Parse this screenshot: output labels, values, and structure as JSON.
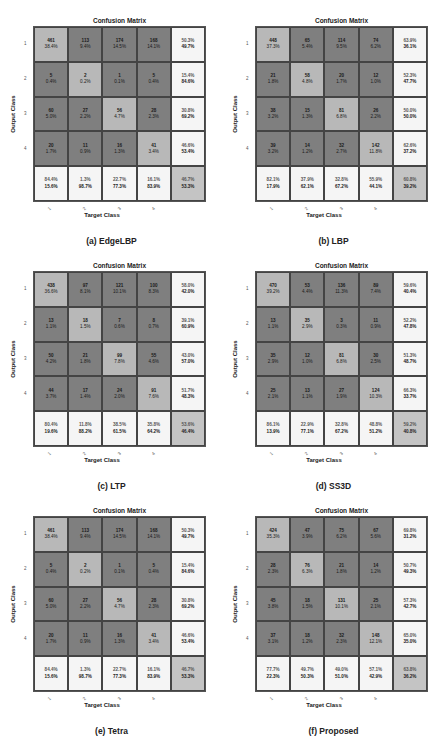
{
  "chart_data": [
    {
      "type": "heatmap",
      "title": "Confusion Matrix",
      "caption": "(a) EdgeLBP",
      "xlabel": "Target Class",
      "ylabel": "Output Class",
      "classes": [
        "1",
        "2",
        "3",
        "4"
      ],
      "counts": [
        [
          461,
          113,
          174,
          168
        ],
        [
          5,
          2,
          1,
          5
        ],
        [
          60,
          27,
          56,
          28
        ],
        [
          20,
          11,
          16,
          41
        ]
      ],
      "cell_percent": [
        [
          "38.4%",
          "9.4%",
          "14.5%",
          "14.1%"
        ],
        [
          "0.4%",
          "0.2%",
          "0.1%",
          "0.4%"
        ],
        [
          "5.0%",
          "2.2%",
          "4.7%",
          "2.3%"
        ],
        [
          "1.7%",
          "0.9%",
          "1.3%",
          "3.4%"
        ]
      ],
      "row_summary": [
        [
          "50.3%",
          "49.7%"
        ],
        [
          "15.4%",
          "84.6%"
        ],
        [
          "30.8%",
          "69.2%"
        ],
        [
          "46.6%",
          "53.4%"
        ]
      ],
      "col_summary": [
        [
          "84.4%",
          "15.6%"
        ],
        [
          "1.3%",
          "98.7%"
        ],
        [
          "22.7%",
          "77.3%"
        ],
        [
          "16.1%",
          "83.9%"
        ]
      ],
      "overall": [
        "46.7%",
        "53.3%"
      ]
    },
    {
      "type": "heatmap",
      "title": "Confusion Matrix",
      "caption": "(b) LBP",
      "xlabel": "Target Class",
      "ylabel": "Output Class",
      "classes": [
        "1",
        "2",
        "3",
        "4"
      ],
      "counts": [
        [
          448,
          65,
          114,
          74
        ],
        [
          21,
          58,
          20,
          12
        ],
        [
          38,
          15,
          81,
          26
        ],
        [
          39,
          14,
          32,
          142
        ]
      ],
      "cell_percent": [
        [
          "37.3%",
          "5.4%",
          "9.5%",
          "6.2%"
        ],
        [
          "1.8%",
          "4.8%",
          "1.7%",
          "1.0%"
        ],
        [
          "3.2%",
          "1.3%",
          "6.8%",
          "2.2%"
        ],
        [
          "3.2%",
          "1.2%",
          "2.7%",
          "11.8%"
        ]
      ],
      "row_summary": [
        [
          "63.9%",
          "36.1%"
        ],
        [
          "52.3%",
          "47.7%"
        ],
        [
          "50.0%",
          "50.0%"
        ],
        [
          "62.6%",
          "37.2%"
        ]
      ],
      "col_summary": [
        [
          "82.1%",
          "17.9%"
        ],
        [
          "37.9%",
          "62.1%"
        ],
        [
          "32.8%",
          "67.2%"
        ],
        [
          "55.9%",
          "44.1%"
        ]
      ],
      "overall": [
        "60.8%",
        "39.2%"
      ]
    },
    {
      "type": "heatmap",
      "title": "Confusion Matrix",
      "caption": "(c) LTP",
      "xlabel": "Target Class",
      "ylabel": "Output Class",
      "classes": [
        "1",
        "2",
        "3",
        "4"
      ],
      "counts": [
        [
          438,
          97,
          121,
          100
        ],
        [
          13,
          18,
          7,
          8
        ],
        [
          50,
          21,
          99,
          55
        ],
        [
          44,
          17,
          24,
          91
        ]
      ],
      "cell_percent": [
        [
          "36.6%",
          "8.1%",
          "10.1%",
          "8.3%"
        ],
        [
          "1.1%",
          "1.5%",
          "0.6%",
          "0.7%"
        ],
        [
          "4.2%",
          "1.8%",
          "7.8%",
          "4.6%"
        ],
        [
          "3.7%",
          "1.4%",
          "2.0%",
          "7.6%"
        ]
      ],
      "row_summary": [
        [
          "58.0%",
          "42.0%"
        ],
        [
          "39.1%",
          "60.9%"
        ],
        [
          "43.0%",
          "57.0%"
        ],
        [
          "51.7%",
          "48.3%"
        ]
      ],
      "col_summary": [
        [
          "80.4%",
          "19.6%"
        ],
        [
          "11.8%",
          "88.2%"
        ],
        [
          "38.5%",
          "61.5%"
        ],
        [
          "35.8%",
          "64.2%"
        ]
      ],
      "overall": [
        "53.6%",
        "46.4%"
      ]
    },
    {
      "type": "heatmap",
      "title": "Confusion Matrix",
      "caption": "(d) SS3D",
      "xlabel": "Target Class",
      "ylabel": "Output Class",
      "classes": [
        "1",
        "2",
        "3",
        "4"
      ],
      "counts": [
        [
          470,
          53,
          136,
          89
        ],
        [
          13,
          35,
          3,
          11
        ],
        [
          35,
          12,
          81,
          30
        ],
        [
          25,
          13,
          27,
          124
        ]
      ],
      "cell_percent": [
        [
          "39.2%",
          "4.4%",
          "11.3%",
          "7.4%"
        ],
        [
          "1.1%",
          "2.9%",
          "0.3%",
          "0.9%"
        ],
        [
          "2.9%",
          "1.0%",
          "6.8%",
          "2.5%"
        ],
        [
          "2.1%",
          "1.1%",
          "1.9%",
          "10.3%"
        ]
      ],
      "row_summary": [
        [
          "59.6%",
          "40.4%"
        ],
        [
          "52.2%",
          "47.8%"
        ],
        [
          "51.3%",
          "48.7%"
        ],
        [
          "66.3%",
          "33.7%"
        ]
      ],
      "col_summary": [
        [
          "86.1%",
          "13.9%"
        ],
        [
          "22.9%",
          "77.1%"
        ],
        [
          "32.8%",
          "67.2%"
        ],
        [
          "48.8%",
          "51.2%"
        ]
      ],
      "overall": [
        "59.2%",
        "40.8%"
      ]
    },
    {
      "type": "heatmap",
      "title": "Confusion Matrix",
      "caption": "(e) Tetra",
      "xlabel": "Target Class",
      "ylabel": "Output Class",
      "classes": [
        "1",
        "2",
        "3",
        "4"
      ],
      "counts": [
        [
          461,
          113,
          174,
          168
        ],
        [
          5,
          2,
          1,
          5
        ],
        [
          60,
          27,
          56,
          28
        ],
        [
          20,
          11,
          16,
          41
        ]
      ],
      "cell_percent": [
        [
          "38.4%",
          "9.4%",
          "14.5%",
          "14.1%"
        ],
        [
          "0.4%",
          "0.2%",
          "0.1%",
          "0.4%"
        ],
        [
          "5.0%",
          "2.2%",
          "4.7%",
          "2.3%"
        ],
        [
          "1.7%",
          "0.9%",
          "1.3%",
          "3.4%"
        ]
      ],
      "row_summary": [
        [
          "50.3%",
          "49.7%"
        ],
        [
          "15.4%",
          "84.6%"
        ],
        [
          "30.8%",
          "69.2%"
        ],
        [
          "46.6%",
          "53.4%"
        ]
      ],
      "col_summary": [
        [
          "84.4%",
          "15.6%"
        ],
        [
          "1.3%",
          "98.7%"
        ],
        [
          "22.7%",
          "77.3%"
        ],
        [
          "16.1%",
          "83.9%"
        ]
      ],
      "overall": [
        "46.7%",
        "53.3%"
      ]
    },
    {
      "type": "heatmap",
      "title": "Confusion Matrix",
      "caption": "(f) Proposed",
      "xlabel": "Target Class",
      "ylabel": "Output Class",
      "classes": [
        "1",
        "2",
        "3",
        "4"
      ],
      "counts": [
        [
          424,
          47,
          75,
          67
        ],
        [
          28,
          76,
          21,
          14
        ],
        [
          45,
          18,
          131,
          25
        ],
        [
          37,
          18,
          32,
          148
        ]
      ],
      "cell_percent": [
        [
          "35.3%",
          "3.9%",
          "6.2%",
          "5.6%"
        ],
        [
          "2.3%",
          "6.3%",
          "1.8%",
          "1.2%"
        ],
        [
          "3.8%",
          "1.5%",
          "10.1%",
          "2.1%"
        ],
        [
          "3.1%",
          "1.2%",
          "2.3%",
          "12.1%"
        ]
      ],
      "row_summary": [
        [
          "69.8%",
          "31.2%"
        ],
        [
          "50.7%",
          "49.3%"
        ],
        [
          "57.3%",
          "42.7%"
        ],
        [
          "65.0%",
          "35.0%"
        ]
      ],
      "col_summary": [
        [
          "77.7%",
          "22.3%"
        ],
        [
          "49.7%",
          "50.3%"
        ],
        [
          "49.0%",
          "51.0%"
        ],
        [
          "57.1%",
          "42.9%"
        ]
      ],
      "overall": [
        "63.8%",
        "36.2%"
      ]
    }
  ]
}
